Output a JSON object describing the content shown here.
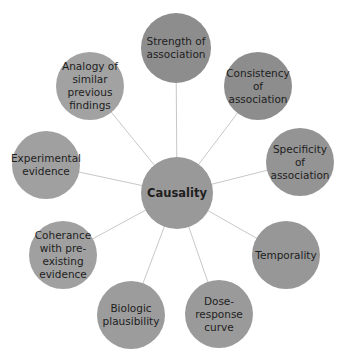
{
  "diagram": {
    "type": "hub-and-spoke",
    "center": {
      "label": "Causality",
      "x": 177,
      "y": 193,
      "r": 36,
      "color": "#999999"
    },
    "edge_color": "#c8c8c8",
    "nodes": [
      {
        "label": "Strength of\nassociation",
        "x": 176,
        "y": 48,
        "r": 35,
        "color": "#8d8d8d"
      },
      {
        "label": "Consistency\nof\nassociation",
        "x": 258,
        "y": 86,
        "r": 34,
        "color": "#8d8d8d"
      },
      {
        "label": "Specificity of\nassociation",
        "x": 300,
        "y": 162,
        "r": 34,
        "color": "#949494"
      },
      {
        "label": "Temporality",
        "x": 286,
        "y": 255,
        "r": 34,
        "color": "#979797"
      },
      {
        "label": "Dose-\nresponse\ncurve",
        "x": 219,
        "y": 314,
        "r": 34,
        "color": "#9a9a9a"
      },
      {
        "label": "Biologic\nplausibility",
        "x": 131,
        "y": 315,
        "r": 34,
        "color": "#9c9c9c"
      },
      {
        "label": "Coherance\nwith pre-\nexisting\nevidence",
        "x": 63,
        "y": 255,
        "r": 34,
        "color": "#a0a0a0"
      },
      {
        "label": "Experimental\nevidence",
        "x": 46,
        "y": 165,
        "r": 34,
        "color": "#a0a0a0"
      },
      {
        "label": "Analogy of\nsimilar\nprevious\nfindings",
        "x": 90,
        "y": 86,
        "r": 34,
        "color": "#a2a2a2"
      }
    ]
  }
}
